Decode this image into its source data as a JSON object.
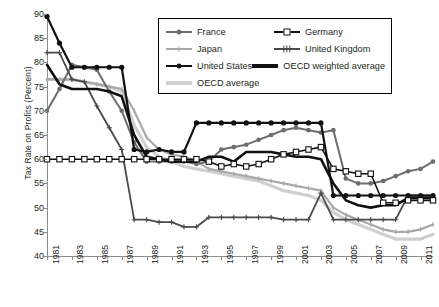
{
  "chart": {
    "type": "line",
    "title": "",
    "xlabel": "",
    "ylabel": "Tax Rate on Profits (Percent)"
  },
  "axes": {
    "y_ticks": [
      "90",
      "85",
      "80",
      "75",
      "70",
      "65",
      "60",
      "55",
      "50",
      "45",
      "40"
    ],
    "y_values": [
      90,
      85,
      80,
      75,
      70,
      65,
      60,
      55,
      50,
      45,
      40
    ],
    "ylim": [
      40,
      90
    ],
    "xlim": [
      1981,
      2012
    ],
    "x_ticks": [
      "1981",
      "1983",
      "1985",
      "1987",
      "1989",
      "1991",
      "1993",
      "1995",
      "1997",
      "1999",
      "2001",
      "2003",
      "2005",
      "2007",
      "2009",
      "2011"
    ],
    "x_values": [
      1981,
      1983,
      1985,
      1987,
      1989,
      1991,
      1993,
      1995,
      1997,
      1999,
      2001,
      2003,
      2005,
      2007,
      2009,
      2011
    ],
    "grid": false
  },
  "legend": {
    "position": "top-center",
    "rows": [
      [
        {
          "label": "France",
          "color": "#6d6d6d",
          "marker": "diamond"
        },
        {
          "label": "Germany",
          "color": "#111111",
          "marker": "square-open"
        }
      ],
      [
        {
          "label": "Japan",
          "color": "#a8a8a8",
          "marker": "dash"
        },
        {
          "label": "United Kingdom",
          "color": "#4a4a4a",
          "marker": "cross"
        }
      ],
      [
        {
          "label": "United States",
          "color": "#111111",
          "marker": "diamond"
        },
        {
          "label": "OECD weighted average",
          "color": "#111111",
          "marker": "line"
        }
      ],
      [
        {
          "label": "OECD average",
          "color": "#cfcfcf",
          "marker": "line"
        }
      ]
    ]
  },
  "chart_data": {
    "type": "line",
    "title": "",
    "xlabel": "",
    "ylabel": "Tax Rate on Profits (Percent)",
    "ylim": [
      40,
      90
    ],
    "xlim": [
      1981,
      2012
    ],
    "grid": false,
    "legend_position": "top-center",
    "x": [
      1981,
      1982,
      1983,
      1984,
      1985,
      1986,
      1987,
      1988,
      1989,
      1990,
      1991,
      1992,
      1993,
      1994,
      1995,
      1996,
      1997,
      1998,
      1999,
      2000,
      2001,
      2002,
      2003,
      2004,
      2005,
      2006,
      2007,
      2008,
      2009,
      2010,
      2011,
      2012
    ],
    "series": [
      {
        "name": "France",
        "color": "#6d6d6d",
        "marker": "diamond",
        "values": [
          70.0,
          74.5,
          79.5,
          79.0,
          78.5,
          74.0,
          70.0,
          63.5,
          59.5,
          59.5,
          59.5,
          59.5,
          59.0,
          59.5,
          62.0,
          62.5,
          63.0,
          64.0,
          65.0,
          66.0,
          66.5,
          66.0,
          65.5,
          66.0,
          56.0,
          55.0,
          55.0,
          55.5,
          56.5,
          57.5,
          58.0,
          59.5
        ]
      },
      {
        "name": "Germany",
        "color": "#111111",
        "marker": "square-open",
        "values": [
          60.0,
          60.0,
          60.0,
          60.0,
          60.0,
          60.0,
          60.0,
          60.0,
          60.0,
          60.0,
          60.0,
          60.0,
          60.0,
          59.5,
          58.5,
          59.0,
          58.5,
          59.0,
          60.0,
          61.0,
          61.5,
          62.0,
          62.5,
          58.0,
          57.5,
          57.0,
          57.0,
          51.0,
          51.0,
          51.5,
          51.5,
          51.5
        ]
      },
      {
        "name": "Japan",
        "color": "#a8a8a8",
        "marker": "dash",
        "values": [
          76.5,
          76.5,
          76.5,
          76.0,
          75.5,
          75.0,
          74.5,
          70.0,
          64.5,
          62.0,
          61.0,
          60.5,
          59.5,
          58.0,
          57.5,
          57.0,
          56.5,
          56.0,
          55.5,
          55.0,
          54.5,
          54.0,
          53.5,
          50.0,
          48.5,
          47.5,
          46.5,
          45.5,
          45.0,
          45.0,
          45.5,
          46.5
        ]
      },
      {
        "name": "United Kingdom",
        "color": "#4a4a4a",
        "marker": "cross",
        "values": [
          82.0,
          82.0,
          76.5,
          76.0,
          71.0,
          66.5,
          62.0,
          47.5,
          47.5,
          47.0,
          47.0,
          46.0,
          46.0,
          48.0,
          48.0,
          48.0,
          48.0,
          48.0,
          48.0,
          47.5,
          47.5,
          47.5,
          53.0,
          47.5,
          47.5,
          47.5,
          47.5,
          47.5,
          47.5,
          52.5,
          52.5,
          52.5
        ]
      },
      {
        "name": "United States",
        "color": "#111111",
        "marker": "diamond",
        "values": [
          89.5,
          84.0,
          79.0,
          79.0,
          79.0,
          79.0,
          79.0,
          62.0,
          61.5,
          62.0,
          61.5,
          61.5,
          67.5,
          67.5,
          67.5,
          67.5,
          67.5,
          67.5,
          67.5,
          67.5,
          67.5,
          67.5,
          67.5,
          52.5,
          52.5,
          52.5,
          52.5,
          52.5,
          52.5,
          52.5,
          52.5,
          52.5
        ]
      },
      {
        "name": "OECD weighted average",
        "color": "#111111",
        "marker": "line",
        "values": [
          79.5,
          75.5,
          74.5,
          74.5,
          74.5,
          74.0,
          73.0,
          65.0,
          60.5,
          60.0,
          59.5,
          59.5,
          59.5,
          60.5,
          60.5,
          59.5,
          61.5,
          61.5,
          61.5,
          61.0,
          60.5,
          60.5,
          60.0,
          55.0,
          51.5,
          50.5,
          50.0,
          50.5,
          50.5,
          52.0,
          52.0,
          52.0
        ]
      },
      {
        "name": "OECD average",
        "color": "#cfcfcf",
        "marker": "line",
        "values": [
          76.5,
          76.5,
          76.5,
          76.0,
          75.5,
          75.0,
          74.0,
          67.0,
          62.5,
          60.5,
          59.5,
          58.5,
          58.0,
          57.5,
          57.0,
          56.5,
          56.0,
          55.5,
          54.5,
          53.5,
          53.0,
          52.5,
          51.5,
          49.0,
          47.5,
          46.5,
          45.5,
          44.5,
          43.5,
          43.5,
          43.5,
          44.5
        ]
      }
    ]
  }
}
